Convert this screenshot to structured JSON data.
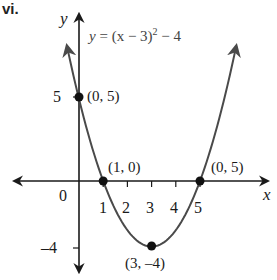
{
  "part_label": "vi.",
  "chart_data": {
    "type": "line",
    "title": "",
    "equation": "y = (x − 3)² − 4",
    "equation_parts": {
      "lhs": "y",
      "mid": " = (x − 3)",
      "exp": "2",
      "tail": " − 4"
    },
    "xlabel": "x",
    "ylabel": "y",
    "origin_label": "0",
    "x_ticks": [
      "1",
      "2",
      "3",
      "4",
      "5"
    ],
    "y_ticks": [
      "5",
      "–4"
    ],
    "xlim": [
      -3.2,
      8.2
    ],
    "ylim": [
      -5.9,
      10.7
    ],
    "grid": false,
    "series": [
      {
        "name": "y = (x − 3)² − 4",
        "x": [
          -0.5,
          0,
          0.5,
          1,
          1.5,
          2,
          2.5,
          3,
          3.5,
          4,
          4.5,
          5,
          5.5,
          6,
          6.5
        ],
        "y": [
          8.25,
          5,
          2.25,
          0,
          -1.75,
          -3,
          -3.75,
          -4,
          -3.75,
          -3,
          -1.75,
          0,
          2.25,
          5,
          8.25
        ],
        "color": "#4a4a4a"
      }
    ],
    "points": [
      {
        "x": 0,
        "y": 5,
        "label": "(0, 5)"
      },
      {
        "x": 1,
        "y": 0,
        "label": "(1, 0)"
      },
      {
        "x": 5,
        "y": 0,
        "label": "(0, 5)"
      },
      {
        "x": 3,
        "y": -4,
        "label": "(3, –4)"
      }
    ],
    "annotations": [
      "(0, 5)",
      "(1, 0)",
      "(0, 5)",
      "(3, –4)"
    ]
  }
}
